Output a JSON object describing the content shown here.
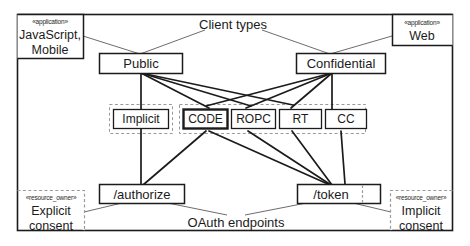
{
  "diagram": {
    "title_labels": {
      "client_types": "Client types",
      "oauth_endpoints": "OAuth endpoints"
    },
    "corners": {
      "top_left": {
        "stereotype": "«application»",
        "line1": "JavaScript,",
        "line2": "Mobile"
      },
      "top_right": {
        "stereotype": "«application»",
        "line1": "Web",
        "line2": ""
      },
      "bottom_left": {
        "stereotype": "«resource_owner»",
        "line1": "Explicit",
        "line2": "consent"
      },
      "bottom_right": {
        "stereotype": "«resource_owner»",
        "line1": "Implicit",
        "line2": "consent"
      }
    },
    "client_types": [
      {
        "id": "public",
        "label": "Public"
      },
      {
        "id": "confidential",
        "label": "Confidential"
      }
    ],
    "grant_types": [
      {
        "id": "implicit",
        "label": "Implicit",
        "emphasis": false
      },
      {
        "id": "code",
        "label": "CODE",
        "emphasis": true
      },
      {
        "id": "ropc",
        "label": "ROPC",
        "emphasis": false
      },
      {
        "id": "rt",
        "label": "RT",
        "emphasis": false
      },
      {
        "id": "cc",
        "label": "CC",
        "emphasis": false
      }
    ],
    "endpoints": [
      {
        "id": "authorize",
        "label": "/authorize"
      },
      {
        "id": "token",
        "label": "/token"
      }
    ],
    "colors": {
      "stroke": "#1b1b1b",
      "stroke_light": "#6d6d6d",
      "dashed": "#9a9a9a",
      "background": "#ffffff"
    },
    "connections": [
      {
        "from": "javascript-mobile",
        "to": "public"
      },
      {
        "from": "client-types",
        "to": "public"
      },
      {
        "from": "client-types",
        "to": "confidential"
      },
      {
        "from": "web",
        "to": "confidential"
      },
      {
        "from": "public",
        "to": "implicit"
      },
      {
        "from": "public",
        "to": "code"
      },
      {
        "from": "public",
        "to": "ropc"
      },
      {
        "from": "public",
        "to": "rt"
      },
      {
        "from": "confidential",
        "to": "code"
      },
      {
        "from": "confidential",
        "to": "ropc"
      },
      {
        "from": "confidential",
        "to": "rt"
      },
      {
        "from": "confidential",
        "to": "cc"
      },
      {
        "from": "implicit",
        "to": "authorize"
      },
      {
        "from": "code",
        "to": "authorize"
      },
      {
        "from": "code",
        "to": "token"
      },
      {
        "from": "ropc",
        "to": "token"
      },
      {
        "from": "rt",
        "to": "token"
      },
      {
        "from": "cc",
        "to": "token"
      },
      {
        "from": "authorize",
        "to": "explicit-consent"
      },
      {
        "from": "authorize",
        "to": "oauth-endpoints"
      },
      {
        "from": "token",
        "to": "oauth-endpoints"
      },
      {
        "from": "token",
        "to": "implicit-consent"
      }
    ]
  }
}
